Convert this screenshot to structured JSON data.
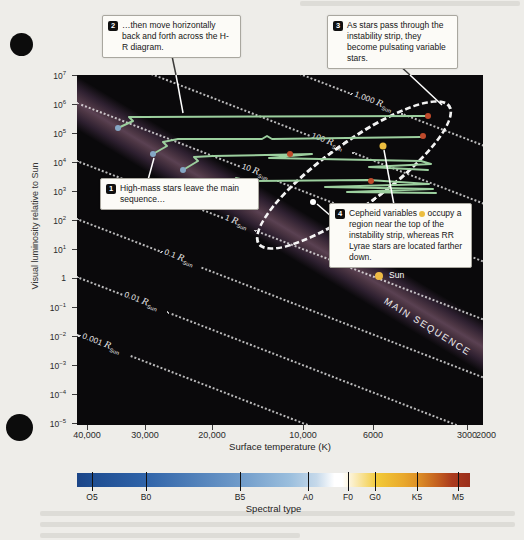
{
  "figure": {
    "radius_symbol": "R",
    "radius_sub": "Sun",
    "labels": {
      "main_sequence": "MAIN SEQUENCE",
      "sun": "Sun",
      "y_title": "Visual luminosity relative to Sun",
      "x_title": "Surface temperature (K)",
      "spectral_title": "Spectral type"
    },
    "callouts": {
      "c1": {
        "num": "1",
        "text": "High-mass stars leave the main sequence…"
      },
      "c2": {
        "num": "2",
        "text": "…then move horizontally back and forth across the H-R diagram."
      },
      "c3": {
        "num": "3",
        "text": "As stars pass through the instability strip, they become pulsating variable stars."
      },
      "c4": {
        "num": "4",
        "text_pre": "Cepheid variables",
        "text_post": " occupy a region near the top of the instability strip, whereas RR Lyrae stars are located farther down."
      }
    }
  },
  "chart_data": {
    "type": "line",
    "xlabel": "Surface temperature (K)",
    "ylabel": "Visual luminosity relative to Sun",
    "x_axis": {
      "scale": "log",
      "direction": "decreasing-right",
      "ticks": [
        40000,
        30000,
        20000,
        10000,
        6000,
        3000,
        2000
      ]
    },
    "y_axis": {
      "scale": "log",
      "min": 1e-05,
      "max": 10000000
    },
    "radius_lines_r_sun": [
      1000,
      100,
      10,
      1,
      0.1,
      0.01,
      0.001
    ],
    "series": [
      {
        "name": "evolution-track-1",
        "points_T_L": [
          [
            33000,
            130000
          ],
          [
            29000,
            300000
          ],
          [
            4200,
            310000
          ]
        ]
      },
      {
        "name": "evolution-track-2",
        "points_T_L": [
          [
            26000,
            20000
          ],
          [
            22000,
            45000
          ],
          [
            4300,
            50000
          ]
        ]
      },
      {
        "name": "evolution-track-3",
        "points_T_L": [
          [
            21000,
            5000
          ],
          [
            18000,
            11000
          ],
          [
            4500,
            9000
          ]
        ]
      },
      {
        "name": "evolution-track-4",
        "points_T_L": [
          [
            17000,
            900
          ],
          [
            14000,
            2500
          ],
          [
            5000,
            2000
          ]
        ]
      }
    ],
    "points": [
      {
        "name": "Sun",
        "T": 5800,
        "L": 1
      },
      {
        "name": "Cepheid example",
        "T": 5300,
        "L": 30000
      },
      {
        "name": "RR Lyrae example",
        "T": 6800,
        "L": 350
      }
    ],
    "annotations": [
      "instability strip (dashed ellipse)",
      "MAIN SEQUENCE band"
    ],
    "legend": "none",
    "grid": "off"
  },
  "colors": {
    "track": "#9ccf9e",
    "start_dot": "#85a7c5",
    "end_dot": "#bf4a2b",
    "cepheid_dot": "#ecbd3f",
    "rr_lyrae_dot": "#ffffff",
    "sun_dot": "#eebb45",
    "leader_dark": "#3a3a38",
    "leader_light": "#ffffff"
  },
  "render": {
    "y_ticks": [
      {
        "base": "10",
        "exp": "7",
        "y": 75
      },
      {
        "base": "10",
        "exp": "6",
        "y": 104
      },
      {
        "base": "10",
        "exp": "5",
        "y": 133
      },
      {
        "base": "10",
        "exp": "4",
        "y": 162
      },
      {
        "base": "10",
        "exp": "3",
        "y": 191
      },
      {
        "base": "10",
        "exp": "2",
        "y": 220
      },
      {
        "base": "10",
        "exp": "1",
        "y": 249
      },
      {
        "base": "1",
        "exp": "",
        "y": 278
      },
      {
        "base": "10",
        "exp": "−1",
        "y": 307
      },
      {
        "base": "10",
        "exp": "−2",
        "y": 336
      },
      {
        "base": "10",
        "exp": "−3",
        "y": 365
      },
      {
        "base": "10",
        "exp": "−4",
        "y": 394
      },
      {
        "base": "10",
        "exp": "−5",
        "y": 423
      }
    ],
    "x_ticks": [
      {
        "label": "40,000",
        "x": 87,
        "tick": true
      },
      {
        "label": "30,000",
        "x": 145,
        "tick": true
      },
      {
        "label": "20,000",
        "x": 212,
        "tick": true
      },
      {
        "label": "10,000",
        "x": 303,
        "tick": true
      },
      {
        "label": "6000",
        "x": 373,
        "tick": true
      },
      {
        "label": "3000",
        "x": 467,
        "tick": true
      },
      {
        "label": "2000",
        "x": 486,
        "tick": false
      }
    ],
    "radius_lines": [
      {
        "value": "1,000",
        "y": -89,
        "gap_start": 296,
        "gap_len": 52
      },
      {
        "value": "100",
        "y": -31,
        "gap_start": 250,
        "gap_len": 46
      },
      {
        "value": "10",
        "y": 27,
        "gap_start": 175,
        "gap_len": 40
      },
      {
        "value": "1",
        "y": 85,
        "gap_start": 157,
        "gap_len": 34
      },
      {
        "value": "0.1",
        "y": 143,
        "gap_start": 92,
        "gap_len": 42
      },
      {
        "value": "0.01",
        "y": 201,
        "gap_start": 49,
        "gap_len": 48
      },
      {
        "value": "0.001",
        "y": 259,
        "gap_start": 4,
        "gap_len": 54
      }
    ],
    "tracks": [
      "41,53 56,46 52,42 66,42 348,41",
      "76,79 90,71 86,67 101,64 185,64 190,61 195,64 344,62",
      "106,95 121,86 117,82 136,81 235,79 192,83 344,86 354,89 292,92 351,95",
      "148,117 163,107 159,103 172,106 292,105 352,109 248,112 356,114 270,117 359,118"
    ],
    "dots": [
      {
        "name": "track-start-dot",
        "x": 41,
        "y": 53,
        "r": 3,
        "color": "start_dot"
      },
      {
        "name": "track-start-dot",
        "x": 76,
        "y": 79,
        "r": 3,
        "color": "start_dot"
      },
      {
        "name": "track-start-dot",
        "x": 106,
        "y": 95,
        "r": 3,
        "color": "start_dot"
      },
      {
        "name": "track-start-dot",
        "x": 148,
        "y": 117,
        "r": 3,
        "color": "start_dot"
      },
      {
        "name": "track-end-dot",
        "x": 351,
        "y": 41,
        "r": 3,
        "color": "end_dot"
      },
      {
        "name": "track-end-dot",
        "x": 346,
        "y": 61,
        "r": 3,
        "color": "end_dot"
      },
      {
        "name": "track-end-dot",
        "x": 213,
        "y": 79,
        "r": 3,
        "color": "end_dot"
      },
      {
        "name": "track-end-dot",
        "x": 294,
        "y": 106,
        "r": 3,
        "color": "end_dot"
      },
      {
        "name": "cepheid-dot",
        "x": 306,
        "y": 71,
        "r": 3.5,
        "color": "cepheid_dot"
      },
      {
        "name": "rr-lyrae-dot",
        "x": 236,
        "y": 127,
        "r": 3,
        "color": "rr_lyrae_dot"
      },
      {
        "name": "sun-dot",
        "x": 302,
        "y": 201,
        "r": 4,
        "color": "sun_dot"
      }
    ],
    "leaders": [
      {
        "x1": 172,
        "y1": 56,
        "x2": 176,
        "y2": 75,
        "color": "leader_dark"
      },
      {
        "x1": 176,
        "y1": 75,
        "x2": 183,
        "y2": 113,
        "color": "leader_light"
      },
      {
        "x1": 398,
        "y1": 64,
        "x2": 410,
        "y2": 75,
        "color": "leader_dark"
      },
      {
        "x1": 410,
        "y1": 75,
        "x2": 442,
        "y2": 105,
        "color": "leader_light"
      },
      {
        "x1": 148,
        "y1": 180,
        "x2": 154,
        "y2": 158,
        "color": "leader_light"
      },
      {
        "x1": 394,
        "y1": 205,
        "x2": 384,
        "y2": 150,
        "color": "leader_light"
      },
      {
        "x1": 332,
        "y1": 217,
        "x2": 317,
        "y2": 204,
        "color": "leader_light"
      }
    ],
    "spectral": {
      "stops": [
        {
          "c": "#1c4587",
          "p": 0
        },
        {
          "c": "#1f4e92",
          "p": 4
        },
        {
          "c": "#2f63a8",
          "p": 17
        },
        {
          "c": "#6e9ac9",
          "p": 41
        },
        {
          "c": "#9abedd",
          "p": 54
        },
        {
          "c": "#c6d9ea",
          "p": 61
        },
        {
          "c": "#ffffff",
          "p": 65.5
        },
        {
          "c": "#ffffff",
          "p": 67.5
        },
        {
          "c": "#fbf0cd",
          "p": 70
        },
        {
          "c": "#f2c937",
          "p": 76.5
        },
        {
          "c": "#e9a92c",
          "p": 83
        },
        {
          "c": "#df9226",
          "p": 86.5
        },
        {
          "c": "#c25d1f",
          "p": 92
        },
        {
          "c": "#aa3a1d",
          "p": 95.5
        },
        {
          "c": "#9a2e1a",
          "p": 100
        }
      ],
      "ticks": [
        {
          "label": "O5",
          "x": 15
        },
        {
          "label": "B0",
          "x": 69
        },
        {
          "label": "B5",
          "x": 163
        },
        {
          "label": "A0",
          "x": 231
        },
        {
          "label": "F0",
          "x": 271
        },
        {
          "label": "G0",
          "x": 298
        },
        {
          "label": "K5",
          "x": 340
        },
        {
          "label": "M5",
          "x": 381
        }
      ]
    }
  }
}
